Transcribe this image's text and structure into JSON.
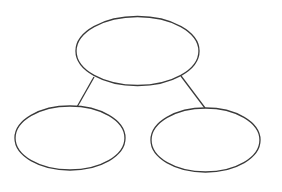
{
  "diagram": {
    "type": "tree",
    "stroke_color": "#3a3a3a",
    "background": "#ffffff",
    "nodes": [
      {
        "id": "root",
        "label": "",
        "cx": 137.5,
        "cy": 51,
        "rx": 61.5,
        "ry": 34.5
      },
      {
        "id": "left-child",
        "label": "",
        "cx": 70,
        "cy": 138,
        "rx": 55,
        "ry": 32
      },
      {
        "id": "right-child",
        "label": "",
        "cx": 205.5,
        "cy": 140,
        "rx": 54.5,
        "ry": 32
      }
    ],
    "edges": [
      {
        "from": "root",
        "to": "left-child"
      },
      {
        "from": "root",
        "to": "right-child"
      }
    ]
  }
}
